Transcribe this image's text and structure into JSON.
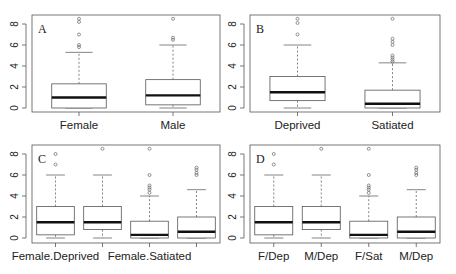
{
  "chart_data": [
    {
      "type": "box",
      "panel_label": "A",
      "ylim": [
        0,
        8.6
      ],
      "yticks": [
        0,
        2,
        4,
        6,
        8
      ],
      "categories": [
        "Female",
        "Male"
      ],
      "tick_labels": [
        "Female",
        "Male"
      ],
      "boxes": [
        {
          "name": "Female",
          "min": 0.0,
          "q1": 0.0,
          "median": 1.0,
          "q3": 2.3,
          "max": 5.3,
          "outliers": [
            5.8,
            6.0,
            7.0,
            8.2,
            8.5
          ]
        },
        {
          "name": "Male",
          "min": 0.0,
          "q1": 0.3,
          "median": 1.2,
          "q3": 2.7,
          "max": 6.0,
          "outliers": [
            6.5,
            6.7,
            8.5
          ]
        }
      ]
    },
    {
      "type": "box",
      "panel_label": "B",
      "ylim": [
        0,
        8.6
      ],
      "yticks": [
        0,
        2,
        4,
        6,
        8
      ],
      "categories": [
        "Deprived",
        "Satiated"
      ],
      "tick_labels": [
        "Deprived",
        "Satiated"
      ],
      "boxes": [
        {
          "name": "Deprived",
          "min": 0.0,
          "q1": 0.7,
          "median": 1.5,
          "q3": 3.0,
          "max": 6.0,
          "outliers": [
            7.0,
            8.1,
            8.5
          ]
        },
        {
          "name": "Satiated",
          "min": 0.0,
          "q1": 0.0,
          "median": 0.4,
          "q3": 1.7,
          "max": 4.3,
          "outliers": [
            4.4,
            4.6,
            4.8,
            5.0,
            6.0,
            6.3,
            6.6,
            8.5
          ]
        }
      ]
    },
    {
      "type": "box",
      "panel_label": "C",
      "ylim": [
        0,
        8.6
      ],
      "yticks": [
        0,
        2,
        4,
        6,
        8
      ],
      "categories": [
        "Female.Deprived",
        "Male.Deprived",
        "Female.Satiated",
        "Male.Satiated"
      ],
      "tick_labels": [
        "Female.Deprived",
        "",
        "Female.Satiated",
        ""
      ],
      "boxes": [
        {
          "name": "Female.Deprived",
          "min": 0.0,
          "q1": 0.3,
          "median": 1.5,
          "q3": 3.0,
          "max": 6.0,
          "outliers": [
            7.0,
            8.0
          ]
        },
        {
          "name": "Male.Deprived",
          "min": 0.0,
          "q1": 0.8,
          "median": 1.5,
          "q3": 3.0,
          "max": 6.0,
          "outliers": [
            8.5
          ]
        },
        {
          "name": "Female.Satiated",
          "min": 0.0,
          "q1": 0.0,
          "median": 0.3,
          "q3": 1.6,
          "max": 4.0,
          "outliers": [
            4.3,
            4.6,
            4.8,
            5.0,
            6.0,
            8.5
          ]
        },
        {
          "name": "Male.Satiated",
          "min": 0.0,
          "q1": 0.0,
          "median": 0.6,
          "q3": 2.0,
          "max": 4.6,
          "outliers": [
            6.0,
            6.2,
            6.5,
            6.7
          ]
        }
      ]
    },
    {
      "type": "box",
      "panel_label": "D",
      "ylim": [
        0,
        8.6
      ],
      "yticks": [
        0,
        2,
        4,
        6,
        8
      ],
      "categories": [
        "F/Dep",
        "M/Dep",
        "F/Sat",
        "M/Dep"
      ],
      "tick_labels": [
        "F/Dep",
        "M/Dep",
        "F/Sat",
        "M/Dep"
      ],
      "boxes": [
        {
          "name": "F/Dep",
          "min": 0.0,
          "q1": 0.3,
          "median": 1.5,
          "q3": 3.0,
          "max": 6.0,
          "outliers": [
            7.0,
            8.0
          ]
        },
        {
          "name": "M/Dep",
          "min": 0.0,
          "q1": 0.8,
          "median": 1.5,
          "q3": 3.0,
          "max": 6.0,
          "outliers": [
            8.5
          ]
        },
        {
          "name": "F/Sat",
          "min": 0.0,
          "q1": 0.0,
          "median": 0.3,
          "q3": 1.6,
          "max": 4.0,
          "outliers": [
            4.3,
            4.6,
            4.8,
            5.0,
            6.0,
            8.5
          ]
        },
        {
          "name": "M/Dep",
          "min": 0.0,
          "q1": 0.0,
          "median": 0.6,
          "q3": 2.0,
          "max": 4.6,
          "outliers": [
            6.0,
            6.2,
            6.5,
            6.7
          ]
        }
      ]
    }
  ],
  "layout": {
    "panels": [
      {
        "frame": [
          32,
          15,
          220,
          112
        ],
        "y0": 108,
        "y8": 24
      },
      {
        "frame": [
          250,
          15,
          440,
          112
        ],
        "y0": 108,
        "y8": 24
      },
      {
        "frame": [
          32,
          145,
          220,
          243
        ],
        "y0": 238,
        "y8": 154
      },
      {
        "frame": [
          250,
          145,
          440,
          243
        ],
        "y0": 238,
        "y8": 154
      }
    ]
  }
}
